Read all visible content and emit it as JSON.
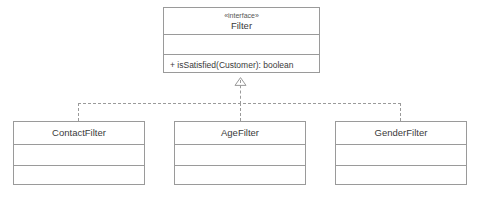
{
  "diagram": {
    "type": "uml-class-diagram",
    "notation": "UML",
    "background_color": "#ffffff",
    "line_color": "#9a9a9a",
    "text_color": "#3a3a3a"
  },
  "interface": {
    "stereotype": "«interface»",
    "name": "Filter",
    "attributes": [],
    "methods": [
      {
        "visibility": "+",
        "text": "+ isSatisfied(Customer): boolean",
        "name": "isSatisfied",
        "parameters": "Customer",
        "return_type": "boolean"
      }
    ]
  },
  "classes": [
    {
      "name": "ContactFilter",
      "attributes": [],
      "methods": []
    },
    {
      "name": "AgeFilter",
      "attributes": [],
      "methods": []
    },
    {
      "name": "GenderFilter",
      "attributes": [],
      "methods": []
    }
  ],
  "relationships": [
    {
      "type": "realization",
      "from": "ContactFilter",
      "to": "Filter",
      "line_style": "dashed",
      "arrowhead": "hollow-triangle"
    },
    {
      "type": "realization",
      "from": "AgeFilter",
      "to": "Filter",
      "line_style": "dashed",
      "arrowhead": "hollow-triangle"
    },
    {
      "type": "realization",
      "from": "GenderFilter",
      "to": "Filter",
      "line_style": "dashed",
      "arrowhead": "hollow-triangle"
    }
  ]
}
